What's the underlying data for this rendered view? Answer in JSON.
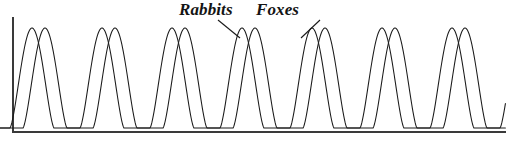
{
  "figure": {
    "width": 506,
    "height": 147,
    "background": "#ffffff",
    "line_color": "#1a1a1a",
    "axis_color": "#3a3a3a"
  },
  "labels": {
    "rabbits": "Rabbits",
    "foxes": "Foxes"
  },
  "chart_data": {
    "type": "line",
    "title": "",
    "xlabel": "",
    "ylabel": "",
    "grid": false,
    "legend": "inline-annotations",
    "axes": {
      "x_axis_visible": true,
      "y_axis_visible": true,
      "x_axis_y_px": 132,
      "y_axis_x_px": 13,
      "y_axis_top_px": 18,
      "x_axis_right_px": 506,
      "xlim": [
        0,
        7.1
      ],
      "ylim": [
        0,
        1.05
      ],
      "tick_labels_x": [],
      "tick_labels_y": []
    },
    "annotations": [
      {
        "text": "Rabbits",
        "label_x_px": 179,
        "label_y_px": 0,
        "leader_from_px": [
          218,
          20
        ],
        "leader_to_px": [
          240,
          38
        ]
      },
      {
        "text": "Foxes",
        "label_x_px": 256,
        "label_y_px": 0,
        "leader_from_px": [
          320,
          20
        ],
        "leader_to_px": [
          301,
          38
        ]
      }
    ],
    "series": [
      {
        "name": "Rabbits",
        "color": "#1a1a1a",
        "peak_count": 7,
        "period_px": 70,
        "first_peak_px": 32,
        "peak_x_px": [
          32,
          102,
          172,
          242,
          312,
          382,
          452
        ],
        "peak_y_px": 28,
        "trough_y_px": 128,
        "peak_value": 1.0,
        "trough_value": 0.04,
        "shape": "sharp-periodic-pulse",
        "pulse_width_px": 44,
        "phase_offset_px": 0
      },
      {
        "name": "Foxes",
        "color": "#1a1a1a",
        "peak_count": 7,
        "period_px": 70,
        "first_peak_px": 45,
        "peak_x_px": [
          45,
          115,
          185,
          255,
          325,
          395,
          465
        ],
        "peak_y_px": 28,
        "trough_y_px": 128,
        "peak_value": 1.0,
        "trough_value": 0.04,
        "shape": "sharp-periodic-pulse",
        "pulse_width_px": 44,
        "phase_offset_px": 13
      }
    ]
  }
}
